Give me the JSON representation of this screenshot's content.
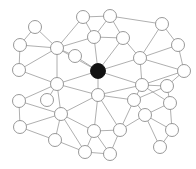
{
  "figure": {
    "title": "",
    "background_color": "#ffffff",
    "width": 196,
    "height": 169
  },
  "chart_data": {
    "type": "scatter",
    "title": "",
    "subtitle": "",
    "xlabel": "",
    "ylabel": "",
    "grid": false,
    "legend": null,
    "graph_kind": "node-link network diagram",
    "node_style": {
      "default_fill": "#ffffff",
      "default_stroke": "#8c8c8c",
      "highlight_fill": "#121212",
      "highlight_stroke": "#121212",
      "radius": 6.5,
      "highlight_radius": 7.5
    },
    "edge_style": {
      "stroke": "#9a9a9a",
      "width": 0.8
    },
    "node_count": 32,
    "edge_count": 68,
    "highlighted_nodes": [
      "n14"
    ],
    "nodes": [
      {
        "id": "n0",
        "x": 35,
        "y": 27,
        "highlight": false
      },
      {
        "id": "n1",
        "x": 20,
        "y": 45,
        "highlight": false
      },
      {
        "id": "n2",
        "x": 19,
        "y": 70,
        "highlight": false
      },
      {
        "id": "n3",
        "x": 57,
        "y": 48,
        "highlight": false
      },
      {
        "id": "n4",
        "x": 83,
        "y": 17,
        "highlight": false
      },
      {
        "id": "n5",
        "x": 110,
        "y": 16,
        "highlight": false
      },
      {
        "id": "n6",
        "x": 94,
        "y": 37,
        "highlight": false
      },
      {
        "id": "n7",
        "x": 123,
        "y": 38,
        "highlight": false
      },
      {
        "id": "n8",
        "x": 162,
        "y": 24,
        "highlight": false
      },
      {
        "id": "n9",
        "x": 178,
        "y": 45,
        "highlight": false
      },
      {
        "id": "n10",
        "x": 140,
        "y": 58,
        "highlight": false
      },
      {
        "id": "n11",
        "x": 184,
        "y": 71,
        "highlight": false
      },
      {
        "id": "n12",
        "x": 142,
        "y": 85,
        "highlight": false
      },
      {
        "id": "n13",
        "x": 57,
        "y": 84,
        "highlight": false
      },
      {
        "id": "n14",
        "x": 98,
        "y": 71,
        "highlight": true
      },
      {
        "id": "n15",
        "x": 98,
        "y": 95,
        "highlight": false
      },
      {
        "id": "n16",
        "x": 19,
        "y": 101,
        "highlight": false
      },
      {
        "id": "n17",
        "x": 61,
        "y": 114,
        "highlight": false
      },
      {
        "id": "n18",
        "x": 20,
        "y": 127,
        "highlight": false
      },
      {
        "id": "n19",
        "x": 55,
        "y": 140,
        "highlight": false
      },
      {
        "id": "n20",
        "x": 94,
        "y": 131,
        "highlight": false
      },
      {
        "id": "n21",
        "x": 120,
        "y": 130,
        "highlight": false
      },
      {
        "id": "n22",
        "x": 85,
        "y": 152,
        "highlight": false
      },
      {
        "id": "n23",
        "x": 110,
        "y": 154,
        "highlight": false
      },
      {
        "id": "n24",
        "x": 145,
        "y": 115,
        "highlight": false
      },
      {
        "id": "n25",
        "x": 170,
        "y": 103,
        "highlight": false
      },
      {
        "id": "n26",
        "x": 172,
        "y": 130,
        "highlight": false
      },
      {
        "id": "n27",
        "x": 160,
        "y": 147,
        "highlight": false
      },
      {
        "id": "n28",
        "x": 134,
        "y": 100,
        "highlight": false
      },
      {
        "id": "n29",
        "x": 75,
        "y": 56,
        "highlight": false
      },
      {
        "id": "n30",
        "x": 47,
        "y": 100,
        "highlight": false
      },
      {
        "id": "n31",
        "x": 167,
        "y": 86,
        "highlight": false
      }
    ],
    "edges": [
      {
        "source": "n0",
        "target": "n1"
      },
      {
        "source": "n0",
        "target": "n3"
      },
      {
        "source": "n1",
        "target": "n2"
      },
      {
        "source": "n1",
        "target": "n3"
      },
      {
        "source": "n2",
        "target": "n3"
      },
      {
        "source": "n2",
        "target": "n13"
      },
      {
        "source": "n3",
        "target": "n4"
      },
      {
        "source": "n3",
        "target": "n6"
      },
      {
        "source": "n3",
        "target": "n14"
      },
      {
        "source": "n3",
        "target": "n13"
      },
      {
        "source": "n3",
        "target": "n29"
      },
      {
        "source": "n4",
        "target": "n5"
      },
      {
        "source": "n4",
        "target": "n6"
      },
      {
        "source": "n5",
        "target": "n6"
      },
      {
        "source": "n5",
        "target": "n8"
      },
      {
        "source": "n5",
        "target": "n7"
      },
      {
        "source": "n6",
        "target": "n7"
      },
      {
        "source": "n6",
        "target": "n14"
      },
      {
        "source": "n7",
        "target": "n10"
      },
      {
        "source": "n7",
        "target": "n14"
      },
      {
        "source": "n8",
        "target": "n9"
      },
      {
        "source": "n8",
        "target": "n10"
      },
      {
        "source": "n9",
        "target": "n10"
      },
      {
        "source": "n9",
        "target": "n11"
      },
      {
        "source": "n10",
        "target": "n11"
      },
      {
        "source": "n10",
        "target": "n12"
      },
      {
        "source": "n10",
        "target": "n14"
      },
      {
        "source": "n11",
        "target": "n12"
      },
      {
        "source": "n11",
        "target": "n31"
      },
      {
        "source": "n12",
        "target": "n14"
      },
      {
        "source": "n12",
        "target": "n15"
      },
      {
        "source": "n12",
        "target": "n28"
      },
      {
        "source": "n12",
        "target": "n31"
      },
      {
        "source": "n12",
        "target": "n25"
      },
      {
        "source": "n13",
        "target": "n14"
      },
      {
        "source": "n13",
        "target": "n15"
      },
      {
        "source": "n13",
        "target": "n16"
      },
      {
        "source": "n13",
        "target": "n17"
      },
      {
        "source": "n13",
        "target": "n30"
      },
      {
        "source": "n14",
        "target": "n15"
      },
      {
        "source": "n14",
        "target": "n29"
      },
      {
        "source": "n15",
        "target": "n17"
      },
      {
        "source": "n15",
        "target": "n20"
      },
      {
        "source": "n15",
        "target": "n21"
      },
      {
        "source": "n15",
        "target": "n28"
      },
      {
        "source": "n16",
        "target": "n18"
      },
      {
        "source": "n16",
        "target": "n17"
      },
      {
        "source": "n17",
        "target": "n18"
      },
      {
        "source": "n17",
        "target": "n19"
      },
      {
        "source": "n17",
        "target": "n20"
      },
      {
        "source": "n17",
        "target": "n22"
      },
      {
        "source": "n18",
        "target": "n19"
      },
      {
        "source": "n19",
        "target": "n22"
      },
      {
        "source": "n20",
        "target": "n21"
      },
      {
        "source": "n20",
        "target": "n22"
      },
      {
        "source": "n20",
        "target": "n23"
      },
      {
        "source": "n21",
        "target": "n23"
      },
      {
        "source": "n21",
        "target": "n24"
      },
      {
        "source": "n21",
        "target": "n28"
      },
      {
        "source": "n22",
        "target": "n23"
      },
      {
        "source": "n24",
        "target": "n25"
      },
      {
        "source": "n24",
        "target": "n26"
      },
      {
        "source": "n24",
        "target": "n27"
      },
      {
        "source": "n24",
        "target": "n28"
      },
      {
        "source": "n25",
        "target": "n26"
      },
      {
        "source": "n25",
        "target": "n31"
      },
      {
        "source": "n26",
        "target": "n27"
      },
      {
        "source": "n28",
        "target": "n31"
      }
    ]
  }
}
